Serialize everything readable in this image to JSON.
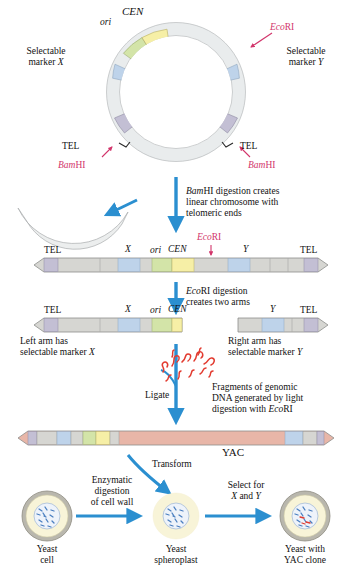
{
  "figure": {
    "colors": {
      "arrow_blue": "#2b8fd0",
      "label_red": "#d2356b",
      "dna_fragment_red": "#e23b30",
      "segment_ori": "#d3e4a8",
      "segment_cen": "#f6efa6",
      "segment_marker": "#bed3ea",
      "segment_tel": "#c3bfd4",
      "backbone_gray": "#d6d6d2",
      "insert_salmon": "#e8b6a8",
      "cell_wall": "#b9b7ad",
      "cell_cytoplasm": "#f8f4d8",
      "nucleus_blue": "#6ea0d8"
    }
  },
  "circle": {
    "name": "circular-yac-vector",
    "labels": {
      "ori": "ori",
      "cen": "CEN",
      "ecori": "EcoRI",
      "marker_x": "Selectable\nmarker X",
      "marker_y": "Selectable\nmarker Y",
      "tel_left": "TEL",
      "tel_right": "TEL",
      "bamhi_left": "BamHI",
      "bamhi_right": "BamHI"
    }
  },
  "steps": {
    "bamhi_digestion": "BamHI digestion creates\nlinear chromosome with\ntelomeric ends",
    "ecori_digestion": "EcoRI digestion\ncreates two arms",
    "ligate": "Ligate",
    "fragments": "Fragments of genomic\nDNA generated by light\ndigestion with EcoRI",
    "transform": "Transform",
    "enzymatic_digestion": "Enzymatic\ndigestion\nof cell wall",
    "select": "Select for\nX and Y"
  },
  "linear_chromosome": {
    "name": "linear-chromosome",
    "labels": {
      "tel_left": "TEL",
      "x": "X",
      "ori": "ori",
      "cen": "CEN",
      "ecori": "EcoRI",
      "y": "Y",
      "tel_right": "TEL"
    }
  },
  "two_arms": {
    "left_arm": {
      "labels": {
        "tel": "TEL",
        "x": "X",
        "ori": "ori",
        "cen": "CEN"
      },
      "caption": "Left arm has\nselectable marker X"
    },
    "right_arm": {
      "labels": {
        "y": "Y",
        "tel": "TEL"
      },
      "caption": "Right arm has\nselectable marker Y"
    }
  },
  "yac": {
    "name": "yac-construct",
    "label": "YAC"
  },
  "cells": [
    {
      "name": "yeast-cell",
      "caption": "Yeast\ncell",
      "has_wall": true,
      "has_yac": false
    },
    {
      "name": "yeast-spheroplast",
      "caption": "Yeast\nspheroplast",
      "has_wall": false,
      "has_yac": false
    },
    {
      "name": "yeast-yac-clone",
      "caption": "Yeast with\nYAC clone",
      "has_wall": true,
      "has_yac": true
    }
  ]
}
